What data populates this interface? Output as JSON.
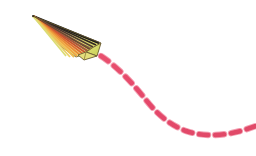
{
  "canvas": {
    "width": 256,
    "height": 156,
    "background_color": "#ffffff",
    "title": "Paper airplane with dashed flight path"
  },
  "scene": {
    "description": "A rainbow-striped origami paper airplane flying up and to the left, leaving a pink dashed curved trail behind it toward the lower right.",
    "subject_label": "paper-airplane",
    "trail_label": "dashed-flight-path"
  },
  "plane": {
    "label": "paper-airplane",
    "heading": "up-left",
    "tip_point": {
      "x": 33,
      "y": 16
    },
    "tail_point": {
      "x": 97,
      "y": 55
    },
    "outline_color": "#3a3024",
    "stripe_colors": [
      "#1a1a1a",
      "#3d3330",
      "#6b4a42",
      "#9c5a4a",
      "#c96a4a",
      "#e07b3c",
      "#ef9438",
      "#f2ae45",
      "#f0c656",
      "#ead870",
      "#dfe07f",
      "#cdd96a"
    ],
    "body_colors": {
      "upper_wing_light": "#f1e6a8",
      "upper_wing_mid": "#e9dd8a",
      "lower_wing": "#f6e9a6",
      "tail_fin": "#d9df6a",
      "shadow": "#b9b36a"
    },
    "parts": [
      {
        "name": "nose-tip",
        "color": "#1a1a1a"
      },
      {
        "name": "upper-wing",
        "color": "#ece08e"
      },
      {
        "name": "lower-wing",
        "color": "#f4e8a4"
      },
      {
        "name": "fuselage-fold",
        "color": "#c9512f"
      },
      {
        "name": "tail-fin",
        "color": "#d6dd63"
      }
    ]
  },
  "trail": {
    "label": "dashed-flight-path",
    "stroke_color": "#e04a68",
    "stroke_highlight": "#f0879c",
    "stroke_width": 5,
    "dash_length": 9,
    "dash_gap": 7,
    "line_cap": "round",
    "start_point": {
      "x": 101,
      "y": 56
    },
    "end_point": {
      "x": 256,
      "y": 127
    },
    "control_points": [
      {
        "x": 128,
        "y": 74
      },
      {
        "x": 152,
        "y": 104
      },
      {
        "x": 178,
        "y": 126
      },
      {
        "x": 215,
        "y": 137
      },
      {
        "x": 245,
        "y": 130
      }
    ],
    "curve_shape": "descending S-curve flattening to the right"
  }
}
